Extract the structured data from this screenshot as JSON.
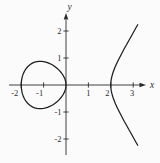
{
  "figure": {
    "background": "#fbfbfb",
    "curve_color": "#1e1e1e",
    "axis_color": "#2b2b2b",
    "text_color": "#2e2e2e"
  },
  "chart_data": {
    "type": "line",
    "title": "",
    "xlabel": "x",
    "ylabel": "y",
    "xlim": [
      -2.5,
      3.5
    ],
    "ylim": [
      -2.6,
      2.6
    ],
    "grid": false,
    "legend": false,
    "x_ticks": [
      {
        "value": -2,
        "label": "-2",
        "dx": -6.5
      },
      {
        "value": -1,
        "label": "-1",
        "dx": -4
      },
      {
        "value": 1,
        "label": "1",
        "dx": 0
      },
      {
        "value": 2,
        "label": "2",
        "dx": -3.5
      },
      {
        "value": 3,
        "label": "3",
        "dx": -1
      }
    ],
    "y_ticks": [
      {
        "value": 2,
        "label": "2"
      },
      {
        "value": 1,
        "label": "1"
      },
      {
        "value": -1,
        "label": "-1"
      },
      {
        "value": -2,
        "label": "-2"
      }
    ],
    "series": [
      {
        "name": "oval",
        "label": "closed oval branch, -2 <= x <= 0",
        "closed": true,
        "points": [
          [
            -2,
            0
          ],
          [
            -1.995,
            0.1
          ],
          [
            -1.97,
            0.244
          ],
          [
            -1.95,
            0.31
          ],
          [
            -1.9,
            0.43
          ],
          [
            -1.85,
            0.517
          ],
          [
            -1.8,
            0.585
          ],
          [
            -1.7,
            0.687
          ],
          [
            -1.6,
            0.759
          ],
          [
            -1.5,
            0.81
          ],
          [
            -1.4,
            0.845
          ],
          [
            -1.3,
            0.866
          ],
          [
            -1.2,
            0.876
          ],
          [
            -1.1,
            0.876
          ],
          [
            -1,
            0.866
          ],
          [
            -0.9,
            0.847
          ],
          [
            -0.8,
            0.82
          ],
          [
            -0.7,
            0.784
          ],
          [
            -0.6,
            0.739
          ],
          [
            -0.5,
            0.685
          ],
          [
            -0.4,
            0.62
          ],
          [
            -0.3,
            0.541
          ],
          [
            -0.2,
            0.445
          ],
          [
            -0.12,
            0.346
          ],
          [
            -0.06,
            0.245
          ],
          [
            -0.02,
            0.141
          ],
          [
            -0.005,
            0.071
          ],
          [
            0,
            0
          ],
          [
            -0.005,
            -0.071
          ],
          [
            -0.02,
            -0.141
          ],
          [
            -0.06,
            -0.245
          ],
          [
            -0.12,
            -0.346
          ],
          [
            -0.2,
            -0.445
          ],
          [
            -0.3,
            -0.541
          ],
          [
            -0.4,
            -0.62
          ],
          [
            -0.5,
            -0.685
          ],
          [
            -0.6,
            -0.739
          ],
          [
            -0.7,
            -0.784
          ],
          [
            -0.8,
            -0.82
          ],
          [
            -0.9,
            -0.847
          ],
          [
            -1,
            -0.866
          ],
          [
            -1.1,
            -0.876
          ],
          [
            -1.2,
            -0.876
          ],
          [
            -1.3,
            -0.866
          ],
          [
            -1.4,
            -0.845
          ],
          [
            -1.5,
            -0.81
          ],
          [
            -1.6,
            -0.759
          ],
          [
            -1.7,
            -0.687
          ],
          [
            -1.8,
            -0.585
          ],
          [
            -1.85,
            -0.517
          ],
          [
            -1.9,
            -0.43
          ],
          [
            -1.95,
            -0.31
          ],
          [
            -1.97,
            -0.244
          ],
          [
            -1.995,
            -0.1
          ]
        ]
      },
      {
        "name": "open",
        "label": "open branch, x >= 2",
        "closed": false,
        "points": [
          [
            3.2,
            2.234
          ],
          [
            3.1,
            2.085
          ],
          [
            3,
            1.936
          ],
          [
            2.9,
            1.788
          ],
          [
            2.8,
            1.64
          ],
          [
            2.7,
            1.49
          ],
          [
            2.6,
            1.339
          ],
          [
            2.5,
            1.186
          ],
          [
            2.4,
            1.028
          ],
          [
            2.3,
            0.861
          ],
          [
            2.2,
            0.68
          ],
          [
            2.1,
            0.464
          ],
          [
            2.05,
            0.322
          ],
          [
            2.02,
            0.201
          ],
          [
            2.005,
            0.1
          ],
          [
            2,
            0
          ],
          [
            2.005,
            -0.1
          ],
          [
            2.02,
            -0.201
          ],
          [
            2.05,
            -0.322
          ],
          [
            2.1,
            -0.464
          ],
          [
            2.2,
            -0.68
          ],
          [
            2.3,
            -0.861
          ],
          [
            2.4,
            -1.028
          ],
          [
            2.5,
            -1.186
          ],
          [
            2.6,
            -1.339
          ],
          [
            2.7,
            -1.49
          ],
          [
            2.8,
            -1.64
          ],
          [
            2.9,
            -1.788
          ],
          [
            3,
            -1.936
          ],
          [
            3.1,
            -2.085
          ],
          [
            3.2,
            -2.234
          ]
        ]
      }
    ]
  }
}
